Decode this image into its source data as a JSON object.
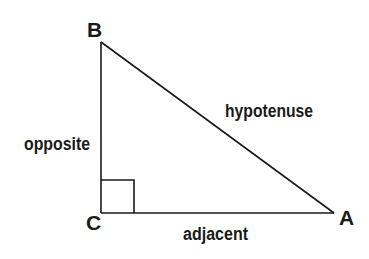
{
  "diagram": {
    "type": "right-triangle",
    "vertices": {
      "A": {
        "label": "A",
        "x": 334,
        "y": 213
      },
      "B": {
        "label": "B",
        "x": 101,
        "y": 42
      },
      "C": {
        "label": "C",
        "x": 101,
        "y": 213
      }
    },
    "sides": {
      "opposite": {
        "label": "opposite"
      },
      "adjacent": {
        "label": "adjacent"
      },
      "hypotenuse": {
        "label": "hypotenuse"
      }
    },
    "right_angle_marker": {
      "at": "C",
      "size": 33
    },
    "colors": {
      "stroke": "#1a1a1a",
      "text": "#1a1a1a",
      "background": "#ffffff"
    }
  }
}
